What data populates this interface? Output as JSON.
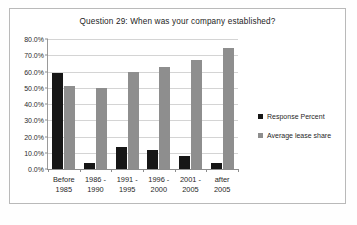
{
  "chart_data": {
    "type": "bar",
    "title": "Question 29: When was your company established?",
    "xlabel": "",
    "ylabel": "",
    "ylim": [
      0,
      80
    ],
    "ytick_labels": [
      "0.0%",
      "10.0%",
      "20.0%",
      "30.0%",
      "40.0%",
      "50.0%",
      "60.0%",
      "70.0%",
      "80.0%"
    ],
    "ytick_values": [
      0,
      10,
      20,
      30,
      40,
      50,
      60,
      70,
      80
    ],
    "grid": true,
    "legend_position": "right",
    "categories": [
      {
        "line1": "Before",
        "line2": "1985"
      },
      {
        "line1": "1986 -",
        "line2": "1990"
      },
      {
        "line1": "1991 -",
        "line2": "1995"
      },
      {
        "line1": "1996 -",
        "line2": "2000"
      },
      {
        "line1": "2001 -",
        "line2": "2005"
      },
      {
        "line1": "after",
        "line2": "2005"
      }
    ],
    "series": [
      {
        "name": "Response Percent",
        "color": "#161616",
        "values": [
          59.0,
          4.0,
          13.5,
          11.5,
          8.0,
          4.0
        ]
      },
      {
        "name": "Average lease share",
        "color": "#8e8e8e",
        "values": [
          51.0,
          50.0,
          60.0,
          63.0,
          67.0,
          74.5
        ]
      }
    ]
  },
  "caption": ""
}
